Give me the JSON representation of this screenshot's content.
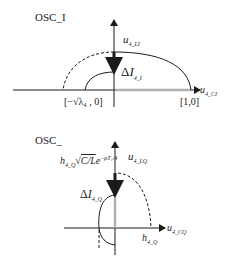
{
  "top": {
    "title": "OSC_I",
    "vertical_axis_label": {
      "var": "u",
      "sub": "4_LI"
    },
    "horizontal_axis_label": {
      "var": "u",
      "sub": "4_CI"
    },
    "delta_label": {
      "prefix": "Δ",
      "var": "I",
      "sub": "4_I"
    },
    "left_point_label": "[−√λ₄ , 0]",
    "right_point_label": "[1,0]"
  },
  "bottom": {
    "title": "OSC_",
    "vertical_axis_label": {
      "var": "u",
      "sub": "4_LQ"
    },
    "horizontal_axis_label": {
      "var": "u",
      "sub": "4_CQ"
    },
    "delta_label": {
      "prefix": "Δ",
      "var": "I",
      "sub": "4_Q"
    },
    "amplitude_label": {
      "var": "h",
      "sub": "4_Q",
      "sqrt": "C/L",
      "exp": "e",
      "exp_power": "−ρT₄/4"
    },
    "h_point_label": {
      "var": "h",
      "sub": "4_Q"
    }
  },
  "colors": {
    "line": "#1a1a1a",
    "gray_segment": "#b0b0b0"
  }
}
